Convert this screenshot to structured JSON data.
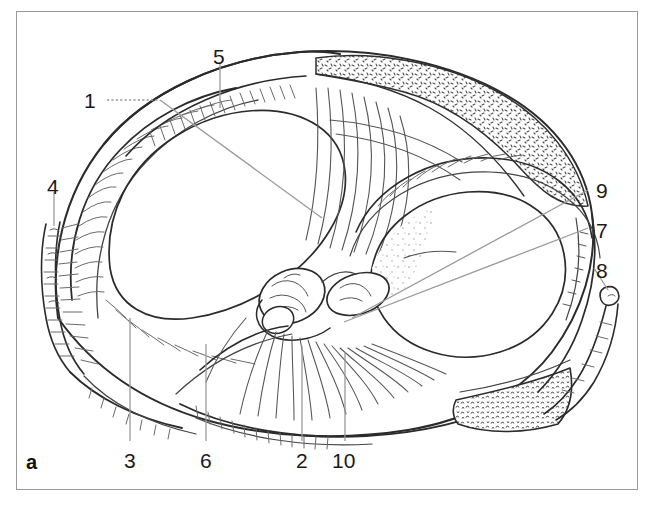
{
  "figure": {
    "panel_letter": "a",
    "type": "anatomical line drawing",
    "frame_color": "#9a9a9a",
    "ink_color": "#333333",
    "leader_color": "#9a9a9a",
    "background_color": "#ffffff"
  },
  "labels": [
    {
      "id": "label-1",
      "text": "1",
      "x": 88,
      "y": 90,
      "anchor": "left"
    },
    {
      "id": "label-2",
      "text": "2",
      "x": 295,
      "y": 450,
      "anchor": "bottom"
    },
    {
      "id": "label-3",
      "text": "3",
      "x": 123,
      "y": 450,
      "anchor": "bottom"
    },
    {
      "id": "label-4",
      "text": "4",
      "x": 46,
      "y": 176,
      "anchor": "top"
    },
    {
      "id": "label-5",
      "text": "5",
      "x": 212,
      "y": 46,
      "anchor": "top"
    },
    {
      "id": "label-6",
      "text": "6",
      "x": 199,
      "y": 450,
      "anchor": "bottom"
    },
    {
      "id": "label-7",
      "text": "7",
      "x": 598,
      "y": 222,
      "anchor": "right"
    },
    {
      "id": "label-8",
      "text": "8",
      "x": 598,
      "y": 262,
      "anchor": "right"
    },
    {
      "id": "label-9",
      "text": "9",
      "x": 598,
      "y": 182,
      "anchor": "right"
    },
    {
      "id": "label-10",
      "text": "10",
      "x": 330,
      "y": 450,
      "anchor": "bottom"
    }
  ],
  "leader_lines": [
    {
      "id": "leader-1",
      "style": "dotted-then-solid",
      "from": [
        107,
        100
      ],
      "to": [
        322,
        216
      ]
    },
    {
      "id": "leader-2",
      "style": "solid",
      "from": [
        302,
        443
      ],
      "to": [
        302,
        345
      ]
    },
    {
      "id": "leader-3",
      "style": "solid",
      "from": [
        130,
        443
      ],
      "to": [
        130,
        318
      ]
    },
    {
      "id": "leader-4",
      "style": "solid",
      "from": [
        54,
        190
      ],
      "to": [
        54,
        222
      ]
    },
    {
      "id": "leader-5",
      "style": "solid",
      "from": [
        220,
        60
      ],
      "to": [
        220,
        108
      ]
    },
    {
      "id": "leader-6",
      "style": "solid",
      "from": [
        206,
        443
      ],
      "to": [
        206,
        345
      ]
    },
    {
      "id": "leader-7",
      "style": "solid",
      "from": [
        588,
        228
      ],
      "to": [
        538,
        286
      ]
    },
    {
      "id": "leader-8",
      "style": "solid",
      "from": [
        592,
        268
      ],
      "to": [
        606,
        290
      ]
    },
    {
      "id": "leader-9",
      "style": "solid",
      "from": [
        588,
        190
      ],
      "to": [
        350,
        318
      ]
    },
    {
      "id": "leader-10",
      "style": "solid",
      "from": [
        345,
        443
      ],
      "to": [
        345,
        352
      ]
    }
  ]
}
